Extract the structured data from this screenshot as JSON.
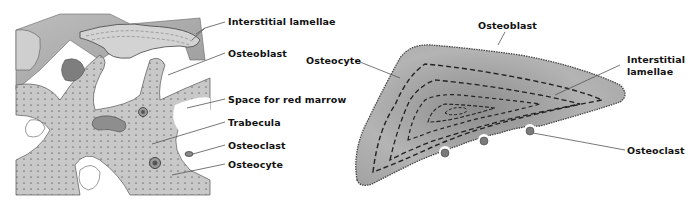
{
  "left_panel": {
    "name": "spongy-bone-trabeculae",
    "labels": [
      {
        "id": "interstitial-lamellae",
        "text": "Interstitial lamellae"
      },
      {
        "id": "osteoblast",
        "text": "Osteoblast"
      },
      {
        "id": "space-for-red-marrow",
        "text": "Space for red marrow"
      },
      {
        "id": "trabecula",
        "text": "Trabecula"
      },
      {
        "id": "osteoclast",
        "text": "Osteoclast"
      },
      {
        "id": "osteocyte",
        "text": "Osteocyte"
      }
    ]
  },
  "right_panel": {
    "name": "trabecula-cross-section",
    "labels": [
      {
        "id": "osteoblast",
        "text": "Osteoblast"
      },
      {
        "id": "osteocyte",
        "text": "Osteocyte"
      },
      {
        "id": "interstitial-lamellae",
        "text": "Interstitial\nlamellae",
        "line1": "Interstitial",
        "line2": "lamellae"
      },
      {
        "id": "osteoclast",
        "text": "Osteoclast"
      }
    ]
  },
  "colors": {
    "bone_light": "#d9d9d9",
    "bone_mid": "#a8a8a8",
    "bone_dark": "#6e6e6e",
    "leader_line": "#555555",
    "text": "#111111"
  }
}
